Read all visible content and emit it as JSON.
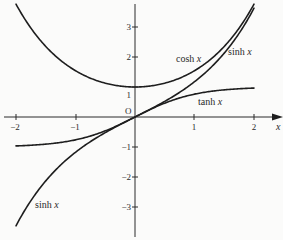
{
  "chart_data": {
    "type": "line",
    "title": "",
    "xlabel": "x",
    "ylabel": "",
    "xlim": [
      -2,
      2
    ],
    "ylim": [
      -3.8,
      3.8
    ],
    "grid": false,
    "legend": "none (curves labelled inline)",
    "x_ticks": [
      "-2",
      "-1",
      "1",
      "2"
    ],
    "y_ticks": [
      "3",
      "2",
      "1",
      "-1",
      "-2",
      "-3"
    ],
    "origin_label": "O",
    "x": [
      -2,
      -1.5,
      -1,
      -0.5,
      0,
      0.5,
      1,
      1.5,
      2
    ],
    "series": [
      {
        "name": "cosh x",
        "values": [
          3.76,
          2.35,
          1.54,
          1.13,
          1.0,
          1.13,
          1.54,
          2.35,
          3.76
        ]
      },
      {
        "name": "sinh x",
        "values": [
          -3.63,
          -2.13,
          -1.18,
          -0.52,
          0.0,
          0.52,
          1.18,
          2.13,
          3.63
        ]
      },
      {
        "name": "tanh x",
        "values": [
          -0.96,
          -0.91,
          -0.76,
          -0.46,
          0.0,
          0.46,
          0.76,
          0.91,
          0.96
        ]
      }
    ],
    "annotations": [
      {
        "text": "cosh x",
        "near": [
          1.0,
          2.0
        ]
      },
      {
        "text": "sinh x",
        "near": [
          1.6,
          2.2
        ]
      },
      {
        "text": "tanh x",
        "near": [
          1.2,
          0.5
        ]
      },
      {
        "text": "sinh x",
        "near": [
          -1.7,
          -2.9
        ]
      }
    ]
  },
  "labels": {
    "origin": "O",
    "x_axis": "x",
    "x_ticks": [
      "−2",
      "−1",
      "1",
      "2"
    ],
    "y_ticks": [
      "3",
      "2",
      "1",
      "−1",
      "−2",
      "−3"
    ],
    "cosh": {
      "fn": "cosh",
      "var": "x"
    },
    "sinh_upper": {
      "fn": "sinh",
      "var": "x"
    },
    "tanh": {
      "fn": "tanh",
      "var": "x"
    },
    "sinh_lower": {
      "fn": "sinh",
      "var": "x"
    }
  },
  "colors": {
    "ink": "#1e1e1e",
    "background": "#fbfbfa"
  }
}
